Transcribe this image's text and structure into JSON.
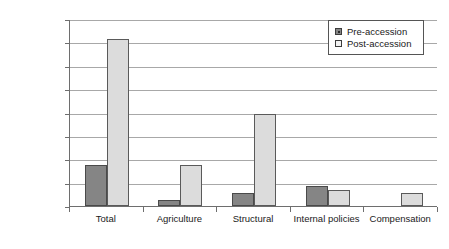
{
  "chart_data": {
    "type": "bar",
    "title": "",
    "subtitle": "",
    "xlabel": "",
    "ylabel": "",
    "categories": [
      "Total",
      "Agriculture",
      "Structural",
      "Internal policies",
      "Compensation"
    ],
    "series": [
      {
        "name": "Pre-accession",
        "color": "#858585",
        "values": [
          3500,
          500,
          1100,
          1700,
          0
        ]
      },
      {
        "name": "Post-accession",
        "color": "#dcdcdc",
        "values": [
          14300,
          3500,
          7900,
          1400,
          1100
        ]
      }
    ],
    "ylim": [
      0,
      16000
    ],
    "ytick_values": [
      0,
      2000,
      4000,
      6000,
      8000,
      10000,
      12000,
      14000,
      16000
    ],
    "ytick_labels": [
      "0 €",
      "2,000 €",
      "4,000€",
      "6,000 €",
      "8,000 €",
      "10,000 €",
      "12,000 €",
      "14,000 €",
      "16,000 €"
    ],
    "grid": true,
    "legend_position": "top-right",
    "legend_entries": [
      "Pre-accession",
      "Post-accession"
    ],
    "annotations": [],
    "currency_symbol": "€"
  }
}
